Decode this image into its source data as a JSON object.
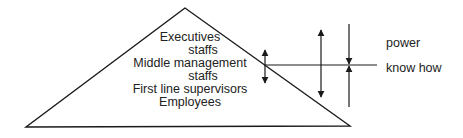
{
  "pyramid": {
    "levels": [
      {
        "label": "Executives",
        "x": 190,
        "y": 31
      },
      {
        "label": "staffs",
        "x": 203,
        "y": 45
      },
      {
        "label": "Middle management",
        "x": 190,
        "y": 58
      },
      {
        "label": "staffs",
        "x": 203,
        "y": 72
      },
      {
        "label": "First line supervisors",
        "x": 190,
        "y": 85
      },
      {
        "label": "Employees",
        "x": 190,
        "y": 98
      }
    ]
  },
  "axis_labels": {
    "power": "power",
    "know_how": "know how"
  },
  "colors": {
    "line": "#1a1a1a",
    "text": "#222222",
    "background": "#ffffff"
  }
}
